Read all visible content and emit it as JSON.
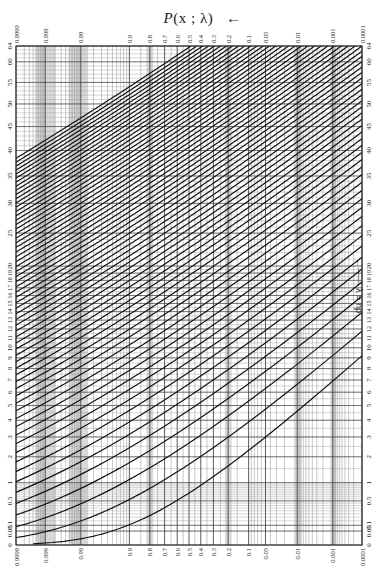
{
  "title": {
    "prefix": "P",
    "args": "(x ; λ)",
    "arrow": "←"
  },
  "right_note": "←—— λ = np",
  "chart_data": {
    "type": "line",
    "subtitle": "Poisson cumulative probability paper (Thorndike chart)",
    "xlabel": "P(x ; λ)",
    "ylabel": "λ = np",
    "x_scale": "normal-probability",
    "y_scale": "square-root",
    "ylim": [
      0,
      64
    ],
    "grid": true,
    "legend": "none",
    "x_tick_labels": [
      "0.9999",
      "0.999",
      "0.99",
      "0.9",
      "0.8",
      "0.7",
      "0.6",
      "0.5",
      "0.4",
      "0.3",
      "0.2",
      "0.1",
      "0.05",
      "0.01",
      "0.001",
      "0.0001"
    ],
    "x_tick_px": [
      17,
      44,
      81,
      131,
      149,
      164,
      177,
      188,
      200,
      212,
      227,
      247,
      264,
      296,
      331,
      362
    ],
    "y_tick_labels": [
      "0",
      "0.05",
      "0.1",
      "0.5",
      "1",
      "2",
      "3",
      "4",
      "5",
      "6",
      "7",
      "8",
      "9",
      "10",
      "11",
      "12",
      "13",
      "14",
      "15",
      "16",
      "17",
      "18",
      "19",
      "20",
      "25",
      "30",
      "35",
      "40",
      "45",
      "50",
      "55",
      "60",
      "64"
    ],
    "y_tick_values": [
      0,
      0.05,
      0.1,
      0.5,
      1,
      2,
      3,
      4,
      5,
      6,
      7,
      8,
      9,
      10,
      11,
      12,
      13,
      14,
      15,
      16,
      17,
      18,
      19,
      20,
      25,
      30,
      35,
      40,
      45,
      50,
      55,
      60,
      64
    ],
    "series_description": "Family of curves, one per x = 0, 1, 2, ..., giving P(X ≤ x) for Poisson mean λ; curves run from lower-left to upper-right",
    "series": [
      {
        "name": "x=0",
        "points": [
          [
            0.9999,
            0.0001
          ],
          [
            0.99,
            0.01
          ],
          [
            0.9,
            0.105
          ],
          [
            0.5,
            0.69
          ],
          [
            0.1,
            2.3
          ],
          [
            0.01,
            4.6
          ],
          [
            0.001,
            6.9
          ],
          [
            0.0001,
            9.2
          ]
        ]
      },
      {
        "name": "x=1",
        "points": [
          [
            0.9999,
            0.014
          ],
          [
            0.99,
            0.15
          ],
          [
            0.9,
            0.53
          ],
          [
            0.5,
            1.68
          ],
          [
            0.1,
            3.89
          ],
          [
            0.01,
            6.64
          ],
          [
            0.001,
            9.23
          ],
          [
            0.0001,
            11.7
          ]
        ]
      },
      {
        "name": "x=2",
        "points": [
          [
            0.9999,
            0.084
          ],
          [
            0.99,
            0.44
          ],
          [
            0.9,
            1.1
          ],
          [
            0.5,
            2.67
          ],
          [
            0.1,
            5.32
          ],
          [
            0.01,
            8.41
          ],
          [
            0.001,
            11.2
          ],
          [
            0.0001,
            13.9
          ]
        ]
      },
      {
        "name": "x=3",
        "points": [
          [
            0.9999,
            0.23
          ],
          [
            0.99,
            0.82
          ],
          [
            0.9,
            1.74
          ],
          [
            0.5,
            3.67
          ],
          [
            0.1,
            6.68
          ],
          [
            0.01,
            10.0
          ],
          [
            0.001,
            13.1
          ],
          [
            0.0001,
            15.9
          ]
        ]
      },
      {
        "name": "x=4",
        "points": [
          [
            0.9999,
            0.45
          ],
          [
            0.99,
            1.28
          ],
          [
            0.9,
            2.43
          ],
          [
            0.5,
            4.67
          ],
          [
            0.1,
            7.99
          ],
          [
            0.01,
            11.6
          ],
          [
            0.001,
            14.8
          ],
          [
            0.0001,
            17.8
          ]
        ]
      },
      {
        "name": "x=5",
        "points": [
          [
            0.9999,
            0.74
          ],
          [
            0.99,
            1.79
          ],
          [
            0.9,
            3.15
          ],
          [
            0.5,
            5.67
          ],
          [
            0.1,
            9.27
          ],
          [
            0.01,
            13.1
          ],
          [
            0.001,
            16.5
          ],
          [
            0.0001,
            19.6
          ]
        ]
      },
      {
        "name": "x=10",
        "points": [
          [
            0.9999,
            2.7
          ],
          [
            0.99,
            4.77
          ],
          [
            0.9,
            7.02
          ],
          [
            0.5,
            10.67
          ],
          [
            0.1,
            15.4
          ],
          [
            0.01,
            20.1
          ],
          [
            0.001,
            24.3
          ],
          [
            0.0001,
            28.0
          ]
        ]
      },
      {
        "name": "x=15",
        "points": [
          [
            0.9999,
            5.3
          ],
          [
            0.99,
            8.2
          ],
          [
            0.9,
            11.2
          ],
          [
            0.5,
            15.67
          ],
          [
            0.1,
            21.3
          ],
          [
            0.01,
            26.8
          ],
          [
            0.001,
            31.5
          ],
          [
            0.0001,
            35.7
          ]
        ]
      },
      {
        "name": "x=20",
        "points": [
          [
            0.9999,
            8.2
          ],
          [
            0.99,
            11.9
          ],
          [
            0.9,
            15.5
          ],
          [
            0.5,
            20.67
          ],
          [
            0.1,
            26.9
          ],
          [
            0.01,
            33.1
          ],
          [
            0.001,
            38.3
          ],
          [
            0.0001,
            42.9
          ]
        ]
      },
      {
        "name": "x=30",
        "points": [
          [
            0.9999,
            14.8
          ],
          [
            0.99,
            19.6
          ],
          [
            0.9,
            24.3
          ],
          [
            0.5,
            30.67
          ],
          [
            0.1,
            38.1
          ],
          [
            0.01,
            45.1
          ],
          [
            0.001,
            51.1
          ],
          [
            0.0001,
            56.4
          ]
        ]
      },
      {
        "name": "x=40",
        "points": [
          [
            0.9999,
            21.9
          ],
          [
            0.99,
            27.7
          ],
          [
            0.9,
            33.2
          ],
          [
            0.5,
            40.67
          ],
          [
            0.1,
            49.0
          ],
          [
            0.01,
            56.8
          ],
          [
            0.001,
            63.4
          ],
          [
            0.0001,
            64.0
          ]
        ]
      },
      {
        "name": "x=50",
        "points": [
          [
            0.9999,
            29.3
          ],
          [
            0.99,
            36.0
          ],
          [
            0.9,
            42.3
          ],
          [
            0.5,
            50.67
          ],
          [
            0.1,
            59.8
          ],
          [
            0.01,
            64.0
          ]
        ]
      },
      {
        "name": "x=60",
        "points": [
          [
            0.9999,
            36.9
          ],
          [
            0.99,
            44.5
          ],
          [
            0.9,
            51.5
          ],
          [
            0.5,
            60.67
          ],
          [
            0.1,
            64.0
          ]
        ]
      }
    ]
  },
  "plot_area_px": {
    "left": 16,
    "right": 362,
    "top": 46,
    "bottom": 545
  }
}
